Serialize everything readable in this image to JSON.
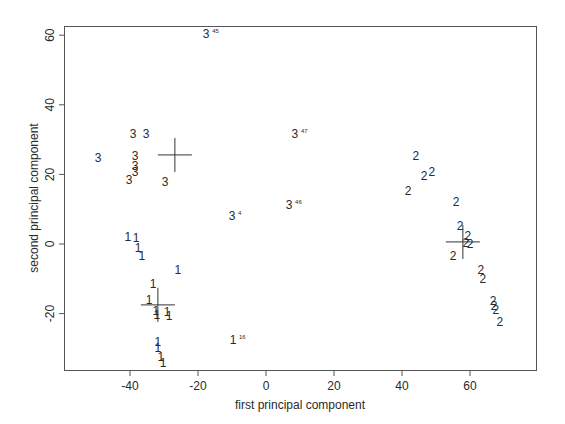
{
  "chart_data": {
    "type": "scatter",
    "title": "",
    "xlabel": "first principal component",
    "ylabel": "second principal component",
    "xlim": [
      -62,
      79
    ],
    "ylim": [
      -36,
      63
    ],
    "grid": false,
    "legend": null,
    "x_ticks": [
      -40,
      -20,
      0,
      20,
      40,
      60
    ],
    "y_ticks": [
      -20,
      0,
      20,
      40,
      60
    ],
    "marker_style": "cluster number used as plotting symbol",
    "series": [
      {
        "name": "1",
        "label": "1",
        "points": [
          {
            "x": -40.6,
            "y": 2.0
          },
          {
            "x": -38.2,
            "y": 1.7
          },
          {
            "x": -37.6,
            "y": -1.1
          },
          {
            "x": -36.5,
            "y": -3.4
          },
          {
            "x": -25.9,
            "y": -7.5
          },
          {
            "x": -33.2,
            "y": -11.5
          },
          {
            "x": -34.4,
            "y": -16.1
          },
          {
            "x": -32.4,
            "y": -19.3
          },
          {
            "x": -32.1,
            "y": -20.4
          },
          {
            "x": -29.1,
            "y": -19.5
          },
          {
            "x": -28.5,
            "y": -20.7
          },
          {
            "x": -31.8,
            "y": -28.2
          },
          {
            "x": -31.8,
            "y": -29.9
          },
          {
            "x": -30.9,
            "y": -32.5
          },
          {
            "x": -30.3,
            "y": -34.2
          },
          {
            "x": -9.7,
            "y": -27.6,
            "annotation": "16"
          }
        ],
        "centroid": {
          "x": -31.8,
          "y": -17.5
        }
      },
      {
        "name": "2",
        "label": "2",
        "points": [
          {
            "x": 44.1,
            "y": 25.3
          },
          {
            "x": 46.5,
            "y": 19.5
          },
          {
            "x": 48.8,
            "y": 20.7
          },
          {
            "x": 41.8,
            "y": 15.2
          },
          {
            "x": 55.9,
            "y": 12.1
          },
          {
            "x": 57.1,
            "y": 5.2
          },
          {
            "x": 59.4,
            "y": 2.3
          },
          {
            "x": 58.8,
            "y": 0.3
          },
          {
            "x": 60.0,
            "y": 0.0
          },
          {
            "x": 55.0,
            "y": -3.4
          },
          {
            "x": 63.2,
            "y": -7.5
          },
          {
            "x": 63.8,
            "y": -10.1
          },
          {
            "x": 66.8,
            "y": -16.4
          },
          {
            "x": 67.1,
            "y": -17.8
          },
          {
            "x": 67.6,
            "y": -19.0
          },
          {
            "x": 68.8,
            "y": -22.4
          }
        ],
        "centroid": {
          "x": 57.9,
          "y": 0.6
        }
      },
      {
        "name": "3",
        "label": "3",
        "points": [
          {
            "x": -39.1,
            "y": 31.6
          },
          {
            "x": -35.3,
            "y": 31.6
          },
          {
            "x": -49.4,
            "y": 24.7
          },
          {
            "x": -38.5,
            "y": 25.3
          },
          {
            "x": -38.5,
            "y": 22.4
          },
          {
            "x": -38.5,
            "y": 20.7
          },
          {
            "x": -40.3,
            "y": 18.4
          },
          {
            "x": -29.7,
            "y": 17.8
          },
          {
            "x": -17.6,
            "y": 60.3,
            "annotation": "45"
          },
          {
            "x": 8.5,
            "y": 31.6,
            "annotation": "47"
          },
          {
            "x": 6.8,
            "y": 11.2,
            "annotation": "46"
          },
          {
            "x": -10.0,
            "y": 8.0,
            "annotation": "4"
          }
        ],
        "centroid": {
          "x": -26.8,
          "y": 25.6
        }
      }
    ]
  }
}
